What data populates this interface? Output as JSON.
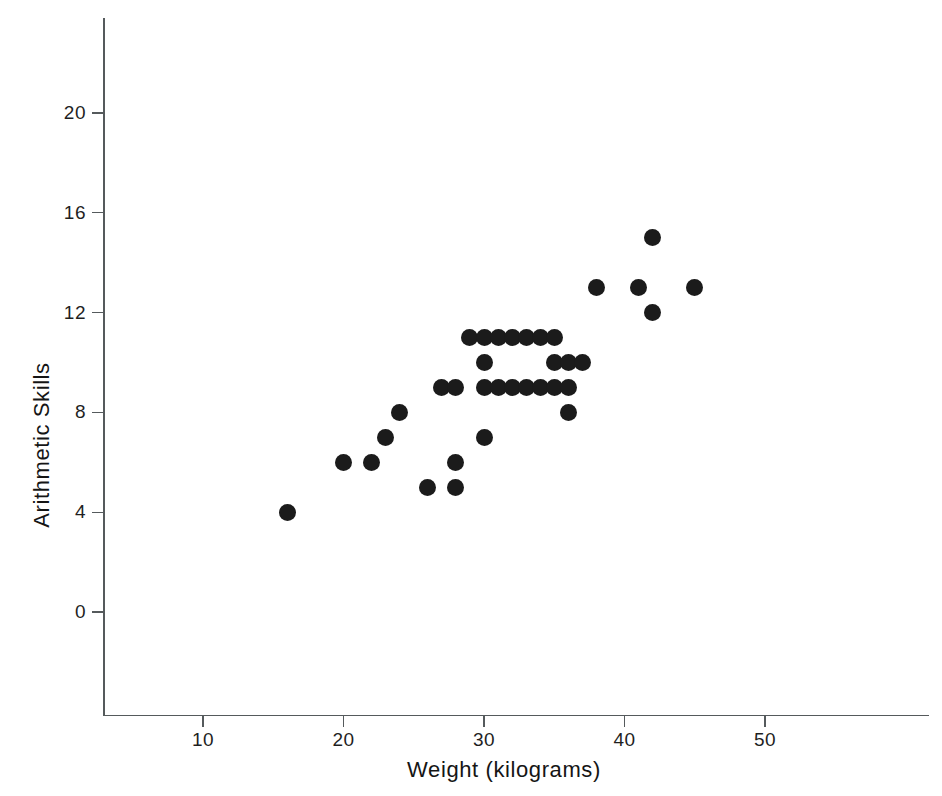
{
  "chart_data": {
    "type": "scatter",
    "title": "",
    "xlabel": "Weight (kilograms)",
    "ylabel": "Arithmetic Skills",
    "xlim": [
      4,
      59
    ],
    "ylim": [
      -3,
      22
    ],
    "xticks": [
      10,
      20,
      30,
      40,
      50
    ],
    "yticks": [
      0,
      4,
      8,
      12,
      16,
      20
    ],
    "xtick_labels": [
      "10",
      "20",
      "30",
      "40",
      "50"
    ],
    "ytick_labels": [
      "0",
      "4",
      "8",
      "12",
      "16",
      "20"
    ],
    "grid": false,
    "legend": false,
    "marker": "filled-circle",
    "marker_color": "#1b1b1b",
    "axis_color": "#555a5c",
    "background_color": "#ffffff",
    "points": [
      {
        "x": 16,
        "y": 4
      },
      {
        "x": 20,
        "y": 6
      },
      {
        "x": 22,
        "y": 6
      },
      {
        "x": 23,
        "y": 7
      },
      {
        "x": 24,
        "y": 8
      },
      {
        "x": 26,
        "y": 5
      },
      {
        "x": 27,
        "y": 9
      },
      {
        "x": 28,
        "y": 9
      },
      {
        "x": 28,
        "y": 6
      },
      {
        "x": 28,
        "y": 5
      },
      {
        "x": 29,
        "y": 11
      },
      {
        "x": 30,
        "y": 11
      },
      {
        "x": 30,
        "y": 10
      },
      {
        "x": 30,
        "y": 9
      },
      {
        "x": 30,
        "y": 7
      },
      {
        "x": 31,
        "y": 11
      },
      {
        "x": 31,
        "y": 9
      },
      {
        "x": 32,
        "y": 11
      },
      {
        "x": 32,
        "y": 9
      },
      {
        "x": 33,
        "y": 11
      },
      {
        "x": 33,
        "y": 9
      },
      {
        "x": 34,
        "y": 11
      },
      {
        "x": 34,
        "y": 9
      },
      {
        "x": 35,
        "y": 11
      },
      {
        "x": 35,
        "y": 10
      },
      {
        "x": 35,
        "y": 9
      },
      {
        "x": 36,
        "y": 10
      },
      {
        "x": 36,
        "y": 9
      },
      {
        "x": 36,
        "y": 8
      },
      {
        "x": 37,
        "y": 10
      },
      {
        "x": 38,
        "y": 13
      },
      {
        "x": 41,
        "y": 13
      },
      {
        "x": 42,
        "y": 15
      },
      {
        "x": 42,
        "y": 12
      },
      {
        "x": 45,
        "y": 13
      }
    ]
  }
}
